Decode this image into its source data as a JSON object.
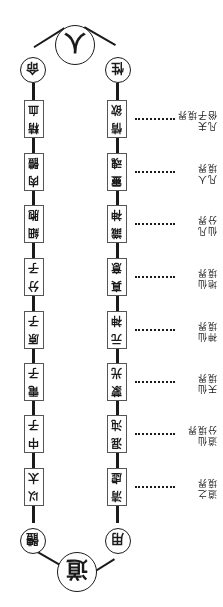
{
  "diagram": {
    "orientation": "rotated-180",
    "top_node": "道",
    "top_branches": {
      "left": "用",
      "right": "體"
    },
    "bottom_node": "人",
    "bottom_branches": {
      "left": "性",
      "right": "命"
    },
    "left_column": [
      {
        "line1": "清",
        "line2": "虛"
      },
      {
        "line1": "混",
        "line2": "沌"
      },
      {
        "line1": "蒙",
        "line2": "光"
      },
      {
        "line1": "元",
        "line2": "神"
      },
      {
        "line1": "真",
        "line2": "意"
      },
      {
        "line1": "識",
        "line2": "神"
      },
      {
        "line1": "靈",
        "line2": "魂"
      },
      {
        "line1": "情",
        "line2": "欲"
      }
    ],
    "right_column": [
      {
        "line1": "以",
        "line2": "太"
      },
      {
        "line1": "中",
        "line2": "子"
      },
      {
        "line1": "電",
        "line2": "子"
      },
      {
        "line1": "原",
        "line2": "子"
      },
      {
        "line1": "分",
        "line2": "子"
      },
      {
        "line1": "細",
        "line2": "胞"
      },
      {
        "line1": "肉",
        "line2": "體"
      },
      {
        "line1": "精",
        "line2": "血"
      }
    ],
    "realm_labels": [
      {
        "line1": "道之",
        "line2": "境界"
      },
      {
        "line1": "道仙",
        "line2": "分境界"
      },
      {
        "line1": "天仙",
        "line2": "境界"
      },
      {
        "line1": "神仙",
        "line2": "境界"
      },
      {
        "line1": "地仙",
        "line2": "境界"
      },
      {
        "line1": "仙凡",
        "line2": "分界"
      },
      {
        "line1": "凡人",
        "line2": "境界"
      },
      {
        "line1": "凡夫",
        "line2": "俗子境界"
      }
    ]
  }
}
